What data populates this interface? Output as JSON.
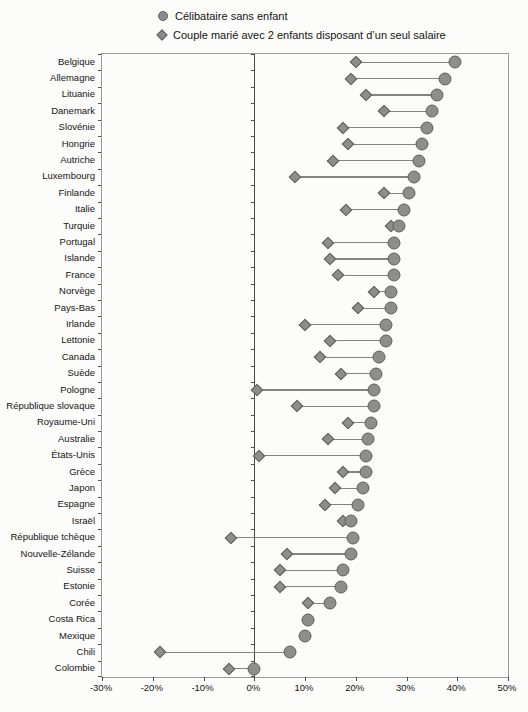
{
  "page": {
    "background": "#fcfcfa"
  },
  "chart_data": {
    "type": "dumbbell",
    "orientation": "horizontal",
    "title": "",
    "xlabel": "",
    "ylabel": "",
    "unit": "%",
    "xlim": [
      -30,
      50
    ],
    "x_ticks": [
      "-30%",
      "-20%",
      "-10%",
      "0%",
      "10%",
      "20%",
      "30%",
      "40%",
      "50%"
    ],
    "x_tick_values": [
      -30,
      -20,
      -10,
      0,
      10,
      20,
      30,
      40,
      50
    ],
    "grid": false,
    "legend_position": "top",
    "categories": [
      "Belgique",
      "Allemagne",
      "Lituanie",
      "Danemark",
      "Slovénie",
      "Hongrie",
      "Autriche",
      "Luxembourg",
      "Finlande",
      "Italie",
      "Turquie",
      "Portugal",
      "Islande",
      "France",
      "Norvège",
      "Pays-Bas",
      "Irlande",
      "Lettonie",
      "Canada",
      "Suède",
      "Pologne",
      "République slovaque",
      "Royaume-Uni",
      "Australie",
      "États-Unis",
      "Grèce",
      "Japon",
      "Espagne",
      "Israël",
      "République tchèque",
      "Nouvelle-Zélande",
      "Suisse",
      "Estonie",
      "Corée",
      "Costa Rica",
      "Mexique",
      "Chili",
      "Colombie"
    ],
    "series": [
      {
        "name": "Célibataire sans enfant",
        "marker": "circle",
        "values": [
          39.5,
          37.5,
          36,
          35,
          34,
          33,
          32.5,
          31.5,
          30.5,
          29.5,
          28.5,
          27.5,
          27.5,
          27.5,
          27,
          27,
          26,
          26,
          24.5,
          24,
          23.5,
          23.5,
          23,
          22.5,
          22,
          22,
          21.5,
          20.5,
          19,
          19.5,
          19,
          17.5,
          17,
          15,
          10.5,
          10,
          7,
          0
        ]
      },
      {
        "name": "Couple marié avec 2 enfants disposant d’un seul salaire",
        "marker": "diamond",
        "values": [
          20,
          19,
          22,
          25.5,
          17.5,
          18.5,
          15.5,
          8,
          25.5,
          18,
          27,
          14.5,
          15,
          16.5,
          23.5,
          20.5,
          10,
          15,
          13,
          17,
          0.5,
          8.5,
          18.5,
          14.5,
          1,
          17.5,
          16,
          14,
          17.5,
          -4.5,
          6.5,
          5,
          5,
          10.5,
          10.5,
          10,
          -18.5,
          -5
        ]
      }
    ],
    "colors": {
      "marker_fill": "#8d8d8d",
      "marker_stroke": "#5e5e5e",
      "connector": "#828282",
      "axis": "#4a4a4a",
      "box_border": "#9a9a9a",
      "text": "#141414"
    }
  }
}
